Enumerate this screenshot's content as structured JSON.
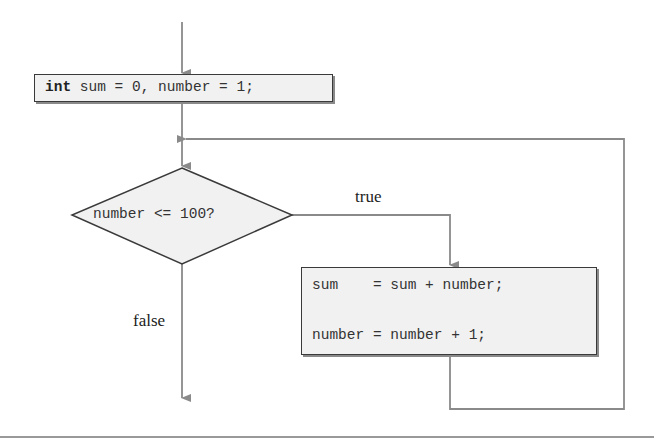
{
  "diagram": {
    "type": "flowchart",
    "init": {
      "keyword": "int",
      "rest": " sum = 0, number = 1;"
    },
    "decision": {
      "condition": "number <= 100?"
    },
    "process": {
      "line1": "sum    = sum + number;",
      "line2": "number = number + 1;"
    },
    "branches": {
      "true_label": "true",
      "false_label": "false"
    },
    "colors": {
      "line": "#8a8a8a",
      "box_fill": "#f1f1f1",
      "border": "#3a3a3a"
    }
  }
}
